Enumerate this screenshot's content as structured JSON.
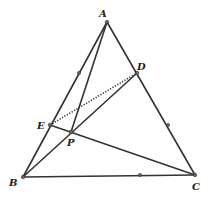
{
  "diagram": {
    "type": "geometry-triangle",
    "points": {
      "A": {
        "label": "A"
      },
      "B": {
        "label": "B"
      },
      "C": {
        "label": "C"
      },
      "D": {
        "label": "D"
      },
      "E": {
        "label": "E"
      },
      "P": {
        "label": "P"
      }
    },
    "segments_solid": [
      [
        "A",
        "B"
      ],
      [
        "A",
        "C"
      ],
      [
        "B",
        "C"
      ],
      [
        "A",
        "P"
      ],
      [
        "B",
        "D"
      ],
      [
        "E",
        "C"
      ]
    ],
    "segments_dotted": [
      [
        "E",
        "D"
      ]
    ],
    "tick_marks": [
      "midpoint-AB",
      "midpoint-AC",
      "midpoint-BC"
    ]
  }
}
